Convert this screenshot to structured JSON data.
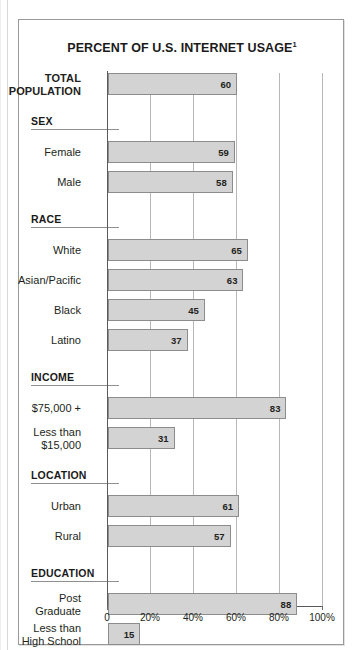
{
  "figure": {
    "title": "PERCENT OF U.S. INTERNET USAGE",
    "title_superscript": "1"
  },
  "colors": {
    "bar_fill": "#d3d3d3",
    "bar_stroke": "#8c8c8c",
    "grid": "#b8b8b8",
    "axis": "#5a5a5a",
    "frame": "#9a9a9a",
    "text": "#231f20"
  },
  "chart_data": {
    "type": "bar",
    "orientation": "horizontal",
    "title": "PERCENT OF U.S. INTERNET USAGE",
    "xlabel": "",
    "ylabel": "",
    "xlim": [
      0,
      100
    ],
    "grid": true,
    "legend": null,
    "xticks": [
      0,
      20,
      40,
      60,
      80,
      100
    ],
    "xtick_labels": [
      "0",
      "20%",
      "40%",
      "60%",
      "80%",
      "100%"
    ],
    "value_suffix": "",
    "groups": [
      {
        "section": null,
        "rows": [
          {
            "label": "TOTAL\nPOPULATION",
            "label_line1": "TOTAL",
            "label_line2": "POPULATION",
            "bold": true,
            "value": 60
          }
        ]
      },
      {
        "section": "SEX",
        "rows": [
          {
            "label": "Female",
            "label_line1": "Female",
            "label_line2": "",
            "bold": false,
            "value": 59
          },
          {
            "label": "Male",
            "label_line1": "Male",
            "label_line2": "",
            "bold": false,
            "value": 58
          }
        ]
      },
      {
        "section": "RACE",
        "rows": [
          {
            "label": "White",
            "label_line1": "White",
            "label_line2": "",
            "bold": false,
            "value": 65
          },
          {
            "label": "Asian/Pacific",
            "label_line1": "Asian/Pacific",
            "label_line2": "",
            "bold": false,
            "value": 63
          },
          {
            "label": "Black",
            "label_line1": "Black",
            "label_line2": "",
            "bold": false,
            "value": 45
          },
          {
            "label": "Latino",
            "label_line1": "Latino",
            "label_line2": "",
            "bold": false,
            "value": 37
          }
        ]
      },
      {
        "section": "INCOME",
        "rows": [
          {
            "label": "$75,000 +",
            "label_line1": "$75,000 +",
            "label_line2": "",
            "bold": false,
            "value": 83
          },
          {
            "label": "Less than $15,000",
            "label_line1": "Less than",
            "label_line2": "$15,000",
            "bold": false,
            "value": 31
          }
        ]
      },
      {
        "section": "LOCATION",
        "rows": [
          {
            "label": "Urban",
            "label_line1": "Urban",
            "label_line2": "",
            "bold": false,
            "value": 61
          },
          {
            "label": "Rural",
            "label_line1": "Rural",
            "label_line2": "",
            "bold": false,
            "value": 57
          }
        ]
      },
      {
        "section": "EDUCATION",
        "rows": [
          {
            "label": "Post Graduate",
            "label_line1": "Post",
            "label_line2": "Graduate",
            "bold": false,
            "value": 88
          },
          {
            "label": "Less than High School",
            "label_line1": "Less than",
            "label_line2": "High School",
            "bold": false,
            "value": 15
          }
        ]
      }
    ]
  }
}
